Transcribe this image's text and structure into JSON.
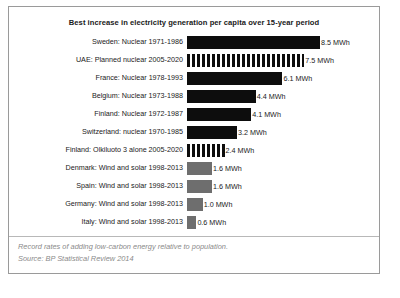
{
  "chart_data": {
    "type": "bar",
    "orientation": "horizontal",
    "title": "Best increase in electricity generation per capita over 15-year period",
    "xlabel": "",
    "ylabel": "",
    "unit": "MWh",
    "xlim": [
      0,
      8.5
    ],
    "grid": false,
    "legend": "none",
    "categories": [
      "Sweden: Nuclear 1971-1986",
      "UAE: Planned nuclear 2005-2020",
      "France: Nuclear 1978-1993",
      "Belgium: Nuclear 1973-1988",
      "Finland: Nuclear 1972-1987",
      "Switzerland: nuclear 1970-1985",
      "Finland: Olkiluoto 3 alone 2005-2020",
      "Denmark: Wind and solar 1998-2013",
      "Spain: Wind and solar 1998-2013",
      "Germany: Wind and solar 1998-2013",
      "Italy: Wind and solar 1998-2013"
    ],
    "values": [
      8.5,
      7.5,
      6.1,
      4.4,
      4.1,
      3.2,
      2.4,
      1.6,
      1.6,
      1.0,
      0.6
    ],
    "value_labels": [
      "8.5 MWh",
      "7.5 MWh",
      "6.1 MWh",
      "4.4 MWh",
      "4.1 MWh",
      "3.2 MWh",
      "2.4 MWh",
      "1.6 MWh",
      "1.6 MWh",
      "1.0 MWh",
      "0.6 MWh"
    ],
    "bar_styles": [
      "solid-dark",
      "striped",
      "solid-dark",
      "solid-dark",
      "solid-dark",
      "solid-dark",
      "striped",
      "solid-gray",
      "solid-gray",
      "solid-gray",
      "solid-gray"
    ],
    "colors": {
      "solid_dark": "#0d0d0d",
      "solid_gray": "#6e6e6e",
      "striped": "#0d0d0d",
      "text": "#1a1a1a",
      "footer_text": "#8a8a8a",
      "border": "#9a9a9a",
      "background": "#ffffff"
    },
    "annotations": [
      "Record rates of adding low-carbon energy relative to population.",
      "Source: BP Statistical Review 2014"
    ]
  },
  "footer": {
    "note": "Record rates of adding low-carbon energy relative to population.",
    "source": "Source: BP Statistical Review 2014"
  }
}
